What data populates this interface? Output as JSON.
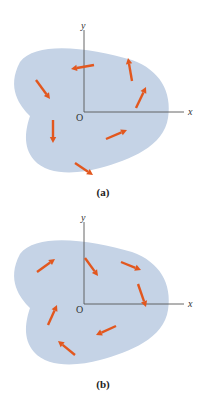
{
  "colors": {
    "body_fill": "#c5d3e6",
    "axis": "#555555",
    "arrow": "#e2571e",
    "label": "#222222"
  },
  "panels": [
    {
      "id": "a",
      "caption": "(a)",
      "offset_y": 0,
      "axes": {
        "x_label": "x",
        "y_label": "y",
        "origin_label": "O",
        "origin": [
          84,
          112
        ],
        "x_end": 184,
        "y_end": 30
      },
      "blob_path": "M 20 62 C 36 40, 92 48, 132 60 C 160 70, 172 92, 168 118 C 164 146, 130 160, 100 168 C 78 174, 48 176, 34 160 C 22 146, 26 128, 30 116 C 20 106, 6 88, 20 62 Z",
      "arrows": [
        {
          "from": [
            94,
            65
          ],
          "to": [
            71,
            69
          ],
          "direction": "left"
        },
        {
          "from": [
            36,
            80
          ],
          "to": [
            50,
            99
          ],
          "direction": "down-right"
        },
        {
          "from": [
            132,
            81
          ],
          "to": [
            128,
            58
          ],
          "direction": "up"
        },
        {
          "from": [
            136,
            108
          ],
          "to": [
            146,
            87
          ],
          "direction": "up-right"
        },
        {
          "from": [
            53,
            120
          ],
          "to": [
            53,
            143
          ],
          "direction": "down"
        },
        {
          "from": [
            106,
            139
          ],
          "to": [
            127,
            130
          ],
          "direction": "right-up"
        },
        {
          "from": [
            75,
            163
          ],
          "to": [
            93,
            175
          ],
          "direction": "down-right"
        }
      ]
    },
    {
      "id": "b",
      "caption": "(b)",
      "offset_y": 200,
      "axes": {
        "x_label": "x",
        "y_label": "y",
        "origin_label": "O",
        "origin": [
          84,
          104
        ],
        "x_end": 184,
        "y_end": 22
      },
      "blob_path": "M 20 54 C 36 32, 92 40, 132 52 C 160 62, 172 84, 168 110 C 164 138, 130 152, 100 160 C 78 166, 48 168, 34 152 C 22 138, 26 120, 30 108 C 20 98, 6 80, 20 54 Z",
      "arrows": [
        {
          "from": [
            37,
            72
          ],
          "to": [
            55,
            59
          ],
          "direction": "up-right"
        },
        {
          "from": [
            85,
            58
          ],
          "to": [
            98,
            76
          ],
          "direction": "down-right"
        },
        {
          "from": [
            121,
            62
          ],
          "to": [
            141,
            70
          ],
          "direction": "right"
        },
        {
          "from": [
            138,
            84
          ],
          "to": [
            146,
            107
          ],
          "direction": "down"
        },
        {
          "from": [
            48,
            125
          ],
          "to": [
            57,
            105
          ],
          "direction": "up"
        },
        {
          "from": [
            116,
            126
          ],
          "to": [
            96,
            135
          ],
          "direction": "left"
        },
        {
          "from": [
            75,
            155
          ],
          "to": [
            58,
            141
          ],
          "direction": "up-left"
        }
      ]
    }
  ]
}
